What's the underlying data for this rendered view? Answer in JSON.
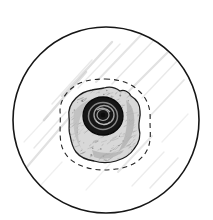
{
  "figure": {
    "panel_label": "(a)",
    "type": "technical-line-drawing",
    "background_color": "#ffffff",
    "outline_color": "#161616",
    "hatch_color": "#c9c9c9",
    "blob_fill_color": "#d8d8d8",
    "core_color": "#121212",
    "dash_color": "#242424",
    "outer_circle": {
      "name": "specimen-boundary-circle",
      "center_x": 106,
      "center_y": 120,
      "radius": 93,
      "stroke_width": 1.6
    },
    "dashed_contour": {
      "name": "damage-zone-dashed-contour",
      "center_x": 105,
      "center_y": 124,
      "radius": 45,
      "dash_pattern": "5 4",
      "stroke_width": 1.1
    },
    "blob": {
      "name": "irregular-particle-blob",
      "center_x": 104,
      "center_y": 124,
      "extent_x": [
        68,
        141
      ],
      "extent_y": [
        88,
        163
      ],
      "stroke_width": 1.3
    },
    "core": {
      "name": "dark-concentric-core",
      "center_x": 103,
      "center_y": 116,
      "radius_x": 20,
      "radius_y": 19,
      "ring_count": 4
    },
    "hatch_strokes": [
      {
        "x1": 26,
        "y1": 168,
        "x2": 74,
        "y2": 112,
        "w": 2.2,
        "o": 0.55
      },
      {
        "x1": 34,
        "y1": 148,
        "x2": 66,
        "y2": 112,
        "w": 1.4,
        "o": 0.42
      },
      {
        "x1": 44,
        "y1": 120,
        "x2": 86,
        "y2": 72,
        "w": 2.6,
        "o": 0.62
      },
      {
        "x1": 52,
        "y1": 104,
        "x2": 92,
        "y2": 60,
        "w": 1.5,
        "o": 0.4
      },
      {
        "x1": 62,
        "y1": 96,
        "x2": 112,
        "y2": 42,
        "w": 2.4,
        "o": 0.58
      },
      {
        "x1": 78,
        "y1": 88,
        "x2": 120,
        "y2": 44,
        "w": 1.3,
        "o": 0.38
      },
      {
        "x1": 96,
        "y1": 82,
        "x2": 142,
        "y2": 34,
        "w": 2.0,
        "o": 0.5
      },
      {
        "x1": 112,
        "y1": 84,
        "x2": 156,
        "y2": 38,
        "w": 1.5,
        "o": 0.44
      },
      {
        "x1": 126,
        "y1": 94,
        "x2": 172,
        "y2": 48,
        "w": 2.3,
        "o": 0.56
      },
      {
        "x1": 142,
        "y1": 98,
        "x2": 178,
        "y2": 60,
        "w": 1.4,
        "o": 0.4
      },
      {
        "x1": 150,
        "y1": 116,
        "x2": 184,
        "y2": 80,
        "w": 1.8,
        "o": 0.46
      },
      {
        "x1": 118,
        "y1": 172,
        "x2": 152,
        "y2": 136,
        "w": 1.9,
        "o": 0.46
      },
      {
        "x1": 132,
        "y1": 186,
        "x2": 164,
        "y2": 152,
        "w": 1.3,
        "o": 0.36
      },
      {
        "x1": 150,
        "y1": 188,
        "x2": 178,
        "y2": 158,
        "w": 1.6,
        "o": 0.4
      },
      {
        "x1": 40,
        "y1": 186,
        "x2": 62,
        "y2": 162,
        "w": 1.2,
        "o": 0.3
      },
      {
        "x1": 24,
        "y1": 142,
        "x2": 48,
        "y2": 116,
        "w": 1.2,
        "o": 0.32
      },
      {
        "x1": 86,
        "y1": 190,
        "x2": 110,
        "y2": 164,
        "w": 1.2,
        "o": 0.28
      },
      {
        "x1": 162,
        "y1": 142,
        "x2": 188,
        "y2": 114,
        "w": 1.3,
        "o": 0.3
      }
    ]
  }
}
